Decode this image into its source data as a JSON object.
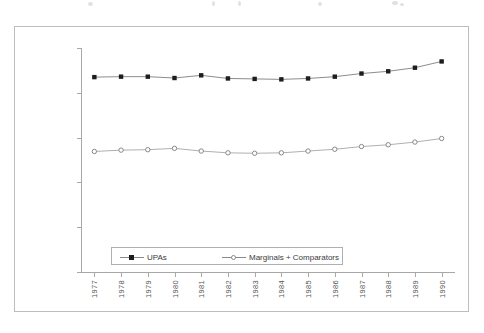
{
  "chart_data": {
    "type": "line",
    "title": "",
    "xlabel": "",
    "ylabel": "",
    "categories": [
      "1977",
      "1978",
      "1979",
      "1980",
      "1981",
      "1982",
      "1983",
      "1984",
      "1985",
      "1986",
      "1987",
      "1988",
      "1989",
      "1990"
    ],
    "ylim": [
      0,
      2500000
    ],
    "ytick_labels": [
      "0",
      "500000",
      "1000000",
      "1500000",
      "2000000",
      "2500000"
    ],
    "ytick_values": [
      0,
      500000,
      1000000,
      1500000,
      2000000,
      2500000
    ],
    "grid": false,
    "legend_position": "bottom",
    "series": [
      {
        "name": "UPAs",
        "marker": "filled-square",
        "color": "#1d1d1d",
        "values": [
          2175000,
          2180000,
          2180000,
          2165000,
          2195000,
          2160000,
          2155000,
          2150000,
          2160000,
          2180000,
          2215000,
          2240000,
          2280000,
          2350000
        ]
      },
      {
        "name": "Marginals + Comparators",
        "marker": "open-circle",
        "color": "#7d7d7d",
        "values": [
          1345000,
          1360000,
          1365000,
          1380000,
          1350000,
          1330000,
          1325000,
          1330000,
          1350000,
          1370000,
          1400000,
          1420000,
          1450000,
          1490000
        ]
      }
    ]
  },
  "legend": {
    "items": [
      {
        "label": "UPAs"
      },
      {
        "label": "Marginals + Comparators"
      }
    ]
  },
  "colors": {
    "frame": "#bdbdbd",
    "axis": "#a8a8a8",
    "series_1": "#1d1d1d",
    "series_2": "#7d7d7d",
    "tick_text": "#555555"
  }
}
